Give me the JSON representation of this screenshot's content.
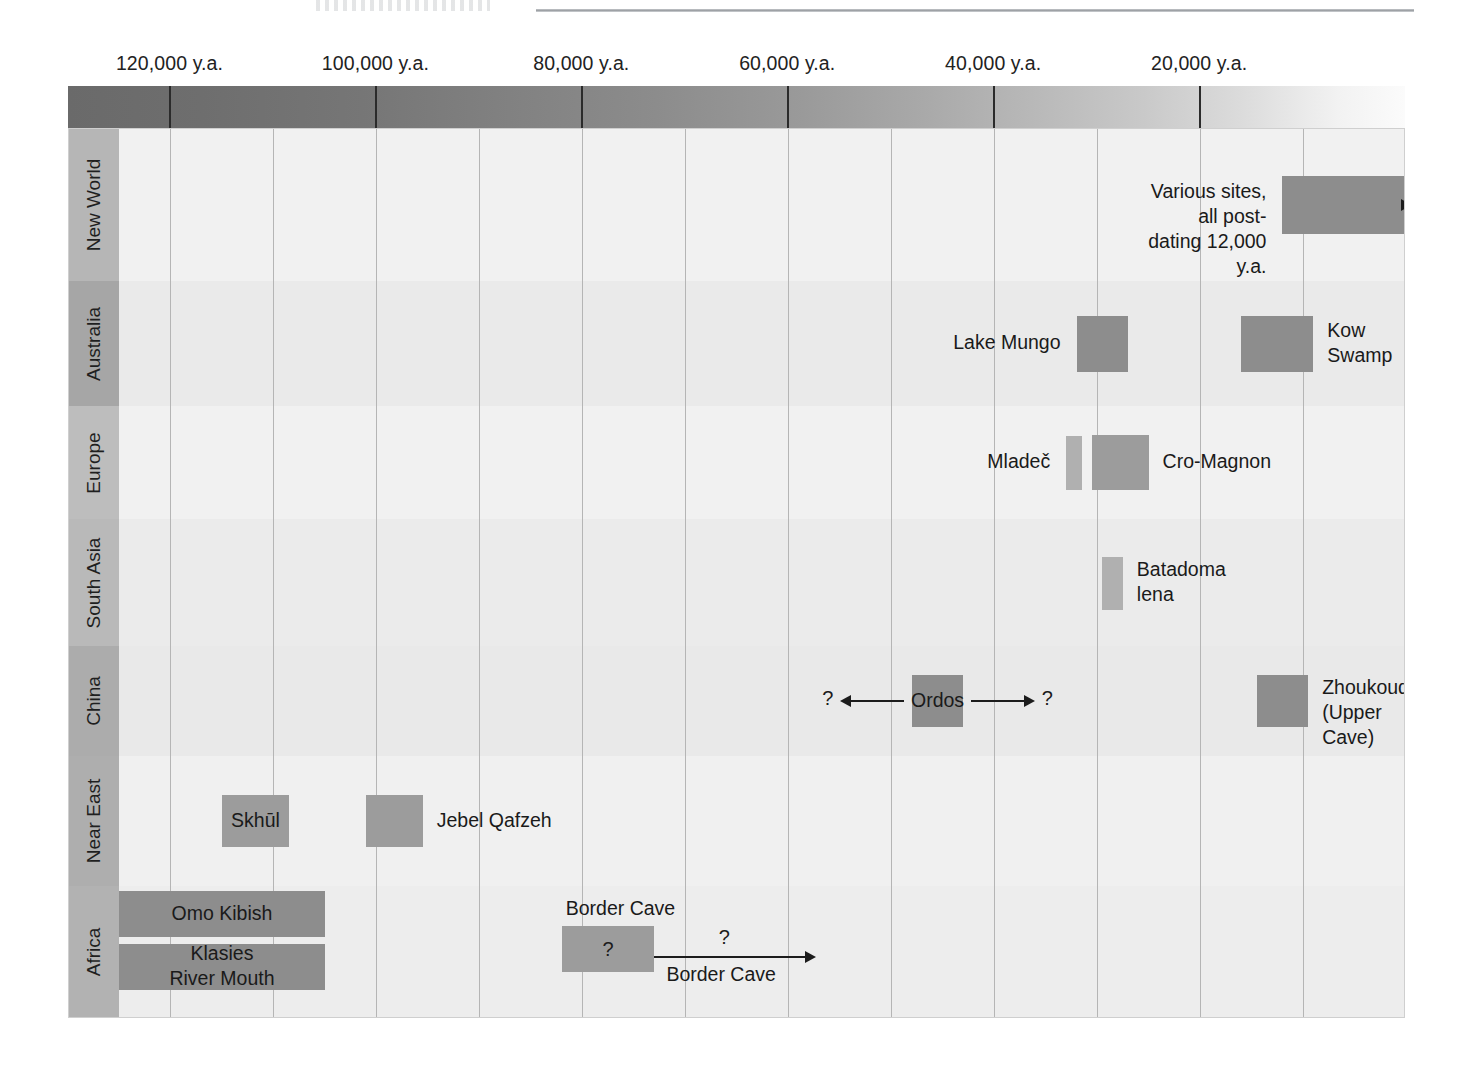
{
  "figure": {
    "title_fragment": "",
    "axis": {
      "unit": "y.a.",
      "range_start": 125000,
      "range_end": 0,
      "top_ticks": [
        "120,000 y.a.",
        "100,000 y.a.",
        "80,000 y.a.",
        "60,000 y.a.",
        "40,000 y.a.",
        "20,000 y.a."
      ],
      "top_tick_values": [
        120000,
        100000,
        80000,
        60000,
        40000,
        20000
      ],
      "inner_ticks": [
        "110,000 y.a.",
        "90,000 y.a.",
        "70,000 y.a.",
        "50,000 y.a.",
        "30,000 y.a.",
        "10,000 y.a."
      ],
      "inner_tick_values": [
        110000,
        90000,
        70000,
        50000,
        30000,
        10000
      ],
      "gradient_description": "dark-to-light left-to-right time gradient"
    },
    "colors": {
      "plot_background": "#f4f4f4",
      "row_band_light": "#f2f2f2",
      "row_band_dark": "#e8e8e8",
      "row_label_dark": "#a8a8a8",
      "row_label_light": "#bdbdbd",
      "bar_dark": "#8d8d8d",
      "bar_mid": "#9c9c9c",
      "bar_light": "#b0b0b0",
      "gridline": "#b5b5b5",
      "ink": "#1c1c1c"
    },
    "rows": [
      {
        "label": "New World",
        "events": [
          {
            "name": "Various sites, all post-dating 12,000 y.a.",
            "label": "Various sites, all post-\ndating 12,000 y.a.",
            "label_side": "left",
            "bar_from": 12000,
            "bar_to": 0,
            "open_ended_right": true,
            "shade": "bar_dark"
          }
        ]
      },
      {
        "label": "Australia",
        "events": [
          {
            "name": "Lake Mungo",
            "label": "Lake Mungo",
            "label_side": "left",
            "bar_from": 32000,
            "bar_to": 27000,
            "shade": "bar_dark"
          },
          {
            "name": "Kow Swamp",
            "label": "Kow\nSwamp",
            "label_side": "right",
            "bar_from": 16000,
            "bar_to": 9000,
            "shade": "bar_dark"
          }
        ]
      },
      {
        "label": "Europe",
        "events": [
          {
            "name": "Mladec",
            "label": "Mladeč",
            "label_side": "left",
            "bar_from": 33000,
            "bar_to": 31500,
            "shade": "bar_light"
          },
          {
            "name": "Cro-Magnon",
            "label": "Cro-Magnon",
            "label_side": "right",
            "bar_from": 30500,
            "bar_to": 25000,
            "shade": "bar_mid"
          }
        ]
      },
      {
        "label": "South Asia",
        "events": [
          {
            "name": "Batadoma lena",
            "label": "Batadoma\nlena",
            "label_side": "right",
            "bar_from": 29500,
            "bar_to": 27500,
            "shade": "bar_light"
          }
        ]
      },
      {
        "label": "China",
        "events": [
          {
            "name": "Ordos",
            "label": "Ordos",
            "label_side": "inside",
            "bar_from": 48000,
            "bar_to": 43000,
            "shade": "bar_dark",
            "uncertain_left": true,
            "uncertain_right": true,
            "uncertain_marker": "?"
          },
          {
            "name": "Zhoukoudian (Upper Cave)",
            "label": "Zhoukoudian\n(Upper Cave)",
            "label_side": "right",
            "bar_from": 14500,
            "bar_to": 9500,
            "shade": "bar_dark"
          }
        ]
      },
      {
        "label": "Near East",
        "events": [
          {
            "name": "Jebel Qafzeh",
            "label": "Jebel Qafzeh",
            "label_side": "right",
            "bar_from": 101000,
            "bar_to": 95500,
            "shade": "bar_mid"
          },
          {
            "name": "Skhul",
            "label": "Skhūl",
            "label_side": "inside",
            "bar_from": 115000,
            "bar_to": 108500,
            "shade": "bar_mid"
          }
        ]
      },
      {
        "label": "Africa",
        "events": [
          {
            "name": "Omo Kibish",
            "label": "Omo Kibish",
            "label_side": "inside",
            "bar_from": 125000,
            "bar_to": 105000,
            "shade": "bar_dark"
          },
          {
            "name": "Klasies River Mouth",
            "label": "Klasies\nRiver Mouth",
            "label_side": "inside",
            "bar_from": 125000,
            "bar_to": 105000,
            "shade": "bar_dark"
          },
          {
            "name": "Border Cave",
            "label": "Border Cave",
            "label_side": "above",
            "bar_from": 82000,
            "bar_to": 73000,
            "shade": "bar_mid",
            "inside_marker": "?",
            "uncertain_right": true,
            "uncertain_marker": "?",
            "arrow_label": "Border Cave"
          }
        ]
      }
    ]
  },
  "chart_data": {
    "type": "timeline",
    "xlabel": "Years ago (y.a.)",
    "ylabel": "Region",
    "x_axis_direction": "older on left, younger on right",
    "xlim": [
      125000,
      0
    ],
    "xticks_major": [
      120000,
      100000,
      80000,
      60000,
      40000,
      20000
    ],
    "xticks_minor": [
      110000,
      90000,
      70000,
      50000,
      30000,
      10000
    ],
    "xtick_labels_major": [
      "120,000 y.a.",
      "100,000 y.a.",
      "80,000 y.a.",
      "60,000 y.a.",
      "40,000 y.a.",
      "20,000 y.a."
    ],
    "xtick_labels_minor": [
      "110,000 y.a.",
      "90,000 y.a.",
      "70,000 y.a.",
      "50,000 y.a.",
      "30,000 y.a.",
      "10,000 y.a."
    ],
    "grid": true,
    "legend": "none",
    "categories": [
      "New World",
      "Australia",
      "Europe",
      "South Asia",
      "China",
      "Near East",
      "Africa"
    ],
    "series": [
      {
        "name": "Various sites, all post-dating 12,000 y.a.",
        "category": "New World",
        "start": 12000,
        "end": 0,
        "open_ended": "right",
        "note": "arrow continues to present"
      },
      {
        "name": "Lake Mungo",
        "category": "Australia",
        "start": 32000,
        "end": 27000
      },
      {
        "name": "Kow Swamp",
        "category": "Australia",
        "start": 16000,
        "end": 9000
      },
      {
        "name": "Mladeč",
        "category": "Europe",
        "start": 33000,
        "end": 31500
      },
      {
        "name": "Cro-Magnon",
        "category": "Europe",
        "start": 30500,
        "end": 25000
      },
      {
        "name": "Batadoma lena",
        "category": "South Asia",
        "start": 29500,
        "end": 27500
      },
      {
        "name": "Ordos",
        "category": "China",
        "start": 48000,
        "end": 43000,
        "uncertain": "both",
        "note": "? on both sides"
      },
      {
        "name": "Zhoukoudian (Upper Cave)",
        "category": "China",
        "start": 14500,
        "end": 9500
      },
      {
        "name": "Jebel Qafzeh",
        "category": "Near East",
        "start": 101000,
        "end": 95500
      },
      {
        "name": "Skhūl",
        "category": "Near East",
        "start": 115000,
        "end": 108500
      },
      {
        "name": "Omo Kibish",
        "category": "Africa",
        "start": 125000,
        "end": 105000,
        "open_ended": "left"
      },
      {
        "name": "Klasies River Mouth",
        "category": "Africa",
        "start": 125000,
        "end": 105000,
        "open_ended": "left"
      },
      {
        "name": "Border Cave",
        "category": "Africa",
        "start": 82000,
        "end": 73000,
        "uncertain": "right",
        "note": "? inside bar and ? above arrow extending right"
      }
    ]
  }
}
